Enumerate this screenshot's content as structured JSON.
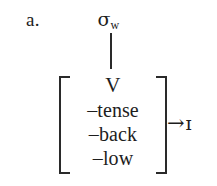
{
  "figure": {
    "item_label": "a.",
    "description_kind": "phonological-rule"
  },
  "tree": {
    "top_node": {
      "base": "σ",
      "subscript": "w"
    },
    "association_line": "|"
  },
  "feature_matrix": {
    "category": "V",
    "features": [
      {
        "sign": "–",
        "name": "tense"
      },
      {
        "sign": "–",
        "name": "back"
      },
      {
        "sign": "–",
        "name": "low"
      }
    ],
    "bracket_left": "[",
    "bracket_right": "]"
  },
  "rule_output": {
    "arrow": "→",
    "segment": "ɪ"
  },
  "colors": {
    "ink": "#1d1d1d",
    "rule": "#2a2a2a",
    "background": "#ffffff"
  }
}
